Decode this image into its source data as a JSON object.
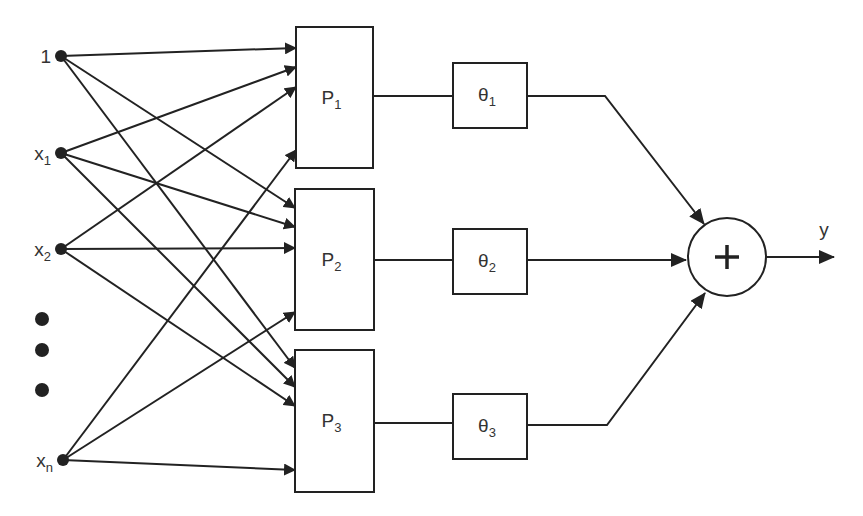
{
  "diagram": {
    "title": "",
    "colors": {
      "stroke": "#222222",
      "text": "#333333",
      "background": "#ffffff"
    },
    "inputs": [
      {
        "id": "in-1",
        "label": "1",
        "sub": "",
        "x": 61,
        "y": 56
      },
      {
        "id": "in-x1",
        "label": "x",
        "sub": "1",
        "x": 61,
        "y": 153
      },
      {
        "id": "in-x2",
        "label": "x",
        "sub": "2",
        "x": 61,
        "y": 249
      },
      {
        "id": "in-xn",
        "label": "x",
        "sub": "n",
        "x": 63,
        "y": 460
      }
    ],
    "ellipsis": [
      {
        "x": 42,
        "y": 319
      },
      {
        "x": 42,
        "y": 350
      },
      {
        "x": 42,
        "y": 390
      }
    ],
    "p_boxes": [
      {
        "id": "P1",
        "label": "P",
        "sub": "1",
        "x": 296,
        "y": 27,
        "w": 77,
        "h": 141,
        "inputs_y": [
          48,
          67,
          87,
          150
        ],
        "out_y": 96
      },
      {
        "id": "P2",
        "label": "P",
        "sub": "2",
        "x": 295,
        "y": 189,
        "w": 79,
        "h": 141,
        "inputs_y": [
          208,
          227,
          248,
          312
        ],
        "out_y": 260
      },
      {
        "id": "P3",
        "label": "P",
        "sub": "3",
        "x": 295,
        "y": 350,
        "w": 79,
        "h": 142,
        "inputs_y": [
          368,
          387,
          406,
          470
        ],
        "out_y": 423
      }
    ],
    "theta_boxes": [
      {
        "id": "theta1",
        "label": "θ",
        "sub": "1",
        "x": 453,
        "y": 63,
        "w": 74,
        "h": 65
      },
      {
        "id": "theta2",
        "label": "θ",
        "sub": "2",
        "x": 453,
        "y": 229,
        "w": 74,
        "h": 65
      },
      {
        "id": "theta3",
        "label": "θ",
        "sub": "3",
        "x": 453,
        "y": 394,
        "w": 74,
        "h": 65
      }
    ],
    "theta_to_sum": [
      {
        "from_x": 527,
        "from_y": 96,
        "bend_x": 605,
        "bend_y": 96,
        "to_x": 704,
        "to_y": 224
      },
      {
        "from_x": 527,
        "from_y": 260,
        "bend_x": 527,
        "bend_y": 260,
        "to_x": 686,
        "to_y": 260
      },
      {
        "from_x": 527,
        "from_y": 425,
        "bend_x": 607,
        "bend_y": 425,
        "to_x": 705,
        "to_y": 293
      }
    ],
    "sum_node": {
      "label": "+",
      "cx": 727,
      "cy": 257,
      "r": 39
    },
    "output": {
      "label": "y",
      "from_x": 766,
      "from_y": 257,
      "to_x": 834,
      "to_y": 257,
      "label_x": 824,
      "label_y": 236
    }
  }
}
